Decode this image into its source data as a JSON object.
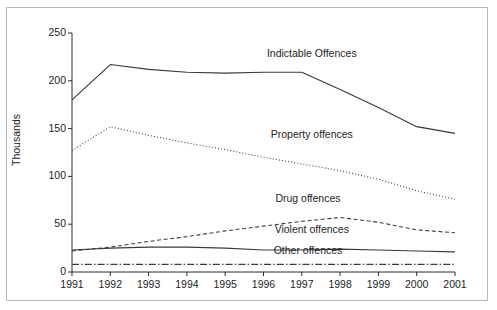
{
  "chart_data": {
    "type": "line",
    "title": "",
    "subtitle": "",
    "xlabel": "",
    "ylabel": "Thousands",
    "x": [
      1991,
      1992,
      1993,
      1994,
      1995,
      1996,
      1997,
      1998,
      1999,
      2000,
      2001
    ],
    "categories": [
      "1991",
      "1992",
      "1993",
      "1994",
      "1995",
      "1996",
      "1997",
      "1998",
      "1999",
      "2000",
      "2001"
    ],
    "xlim": [
      1991,
      2001
    ],
    "ylim": [
      0,
      250
    ],
    "yticks": [
      0,
      50,
      100,
      150,
      200,
      250
    ],
    "ytick_labels": [
      "0",
      "50",
      "100",
      "150",
      "200",
      "250"
    ],
    "grid": false,
    "legend": "inline-annotations",
    "series": [
      {
        "name": "Indictable Offences",
        "style": "solid",
        "color": "#3a3a3a",
        "values": [
          180,
          217,
          212,
          209,
          208,
          209,
          209,
          191,
          172,
          152,
          145
        ]
      },
      {
        "name": "Property offences",
        "style": "dotted",
        "color": "#3a3a3a",
        "values": [
          127,
          152,
          143,
          135,
          128,
          120,
          113,
          106,
          97,
          85,
          76
        ]
      },
      {
        "name": "Drug offences",
        "style": "dashed",
        "color": "#3a3a3a",
        "values": [
          22,
          26,
          32,
          37,
          43,
          48,
          53,
          57,
          52,
          44,
          41
        ]
      },
      {
        "name": "Violent offences",
        "style": "solid",
        "color": "#3a3a3a",
        "values": [
          23,
          25,
          26,
          26,
          25,
          23,
          23,
          24,
          23,
          22,
          21
        ]
      },
      {
        "name": "Other offences",
        "style": "dashdot",
        "color": "#3a3a3a",
        "values": [
          8,
          8,
          8,
          8,
          8,
          8,
          8,
          8,
          8,
          8,
          8
        ]
      }
    ],
    "annotations": [
      {
        "text": "Indictable Offences",
        "x": 1997.0,
        "y": 228
      },
      {
        "text": "Property offences",
        "x": 1997.0,
        "y": 143
      },
      {
        "text": "Drug offences",
        "x": 1996.9,
        "y": 76
      },
      {
        "text": "Violent offences",
        "x": 1997.0,
        "y": 44
      },
      {
        "text": "Other offences",
        "x": 1996.9,
        "y": 22
      }
    ]
  }
}
